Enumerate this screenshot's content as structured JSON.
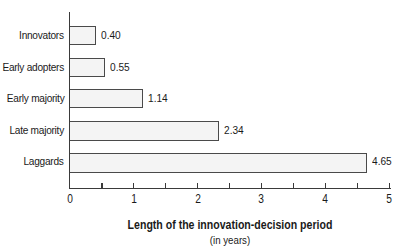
{
  "chart_data": {
    "type": "bar",
    "orientation": "horizontal",
    "categories": [
      "Innovators",
      "Early adopters",
      "Early majority",
      "Late majority",
      "Laggards"
    ],
    "values": [
      0.4,
      0.55,
      1.14,
      2.34,
      4.65
    ],
    "value_labels": [
      "0.40",
      "0.55",
      "1.14",
      "2.34",
      "4.65"
    ],
    "title": "",
    "xlabel": "Length of the innovation-decision period",
    "xlabel_sub": "(in years)",
    "ylabel": "",
    "xlim": [
      0,
      5
    ],
    "x_ticks": [
      "0",
      "1",
      "2",
      "3",
      "4",
      "5"
    ],
    "grid": false,
    "legend": null,
    "colors": {
      "bar_fill": "#f4f4f4",
      "bar_border": "#4a4a4a",
      "axis": "#3a3a3a"
    }
  }
}
